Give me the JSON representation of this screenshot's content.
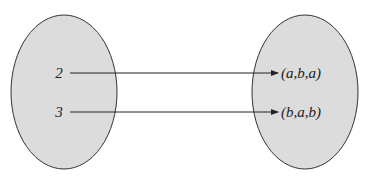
{
  "diagram": {
    "type": "function-mapping",
    "domain_set": {
      "elements": [
        "2",
        "3"
      ],
      "fill": "#dcdcdc",
      "stroke": "#333333"
    },
    "codomain_set": {
      "elements": [
        "(a,b,a)",
        "(b,a,b)"
      ],
      "fill": "#dcdcdc",
      "stroke": "#333333"
    },
    "mappings": [
      {
        "from": "2",
        "to": "(a,b,a)"
      },
      {
        "from": "3",
        "to": "(b,a,b)"
      }
    ]
  }
}
